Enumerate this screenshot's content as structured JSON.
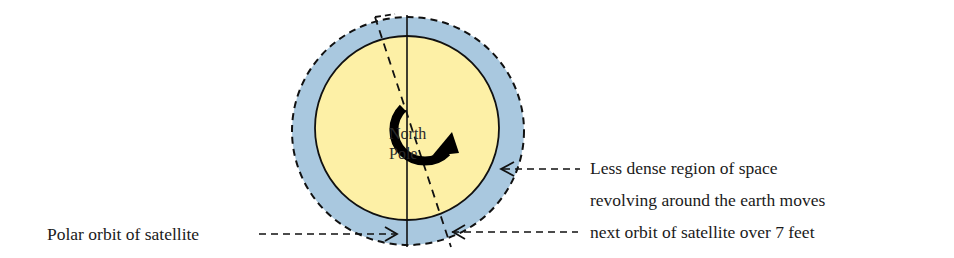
{
  "diagram": {
    "center_label": {
      "line1": "North",
      "line2": "Pole"
    },
    "labels": {
      "polar_orbit": "Polar orbit of satellite",
      "less_dense_line1": "Less dense region of space",
      "less_dense_line2": "revolving around the earth moves",
      "less_dense_line3": "next orbit of satellite over 7 feet"
    },
    "colors": {
      "earth_fill": "#fdf0a6",
      "space_ring_fill": "#a9c8df",
      "stroke": "#111111"
    }
  }
}
